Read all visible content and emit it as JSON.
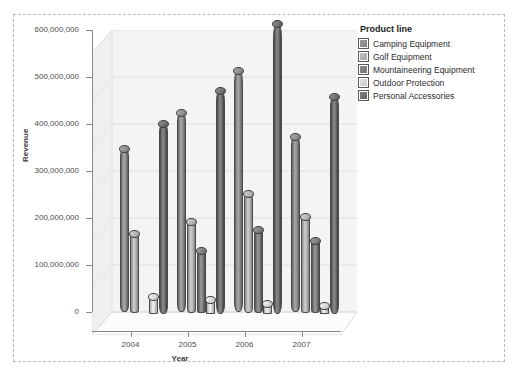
{
  "chart_data": {
    "type": "bar",
    "title": "",
    "xlabel": "Year",
    "ylabel": "Revenue",
    "categories": [
      "2004",
      "2005",
      "2006",
      "2007"
    ],
    "ylim": [
      0,
      600000000
    ],
    "yticks": [
      0,
      100000000,
      200000000,
      300000000,
      400000000,
      500000000,
      600000000
    ],
    "ytick_labels": [
      "0",
      "100,000,000",
      "200,000,000",
      "300,000,000",
      "400,000,000",
      "500,000,000",
      "600,000,000"
    ],
    "grid": true,
    "legend_position": "right",
    "legend_title": "Product line",
    "series": [
      {
        "name": "Camping Equipment",
        "values": [
          350000000,
          425000000,
          515000000,
          375000000
        ]
      },
      {
        "name": "Golf Equipment",
        "values": [
          170000000,
          195000000,
          255000000,
          205000000
        ]
      },
      {
        "name": "Mountaineering Equipment",
        "values": [
          0,
          135000000,
          180000000,
          155000000
        ]
      },
      {
        "name": "Outdoor Protection",
        "values": [
          38000000,
          32000000,
          22000000,
          18000000
        ]
      },
      {
        "name": "Personal Accessories",
        "values": [
          408000000,
          478000000,
          620000000,
          465000000
        ]
      }
    ]
  },
  "legend": {
    "title": "Product line",
    "items": [
      {
        "label": "Camping Equipment",
        "color": "#8e8e8e"
      },
      {
        "label": "Golf Equipment",
        "color": "#b3b3b3"
      },
      {
        "label": "Mountaineering Equipment",
        "color": "#7e7e7e"
      },
      {
        "label": "Outdoor Protection",
        "color": "#d6d6d6"
      },
      {
        "label": "Personal Accessories",
        "color": "#6f6f6f"
      }
    ]
  },
  "axes": {
    "y_title": "Revenue",
    "x_title": "Year"
  },
  "colors": {
    "plot_background": "#f4f4f4",
    "frame_border": "#b9b9b9",
    "gridline": "#dcdcdc",
    "axis": "#8a8a8a",
    "text": "#4d4d4d"
  }
}
